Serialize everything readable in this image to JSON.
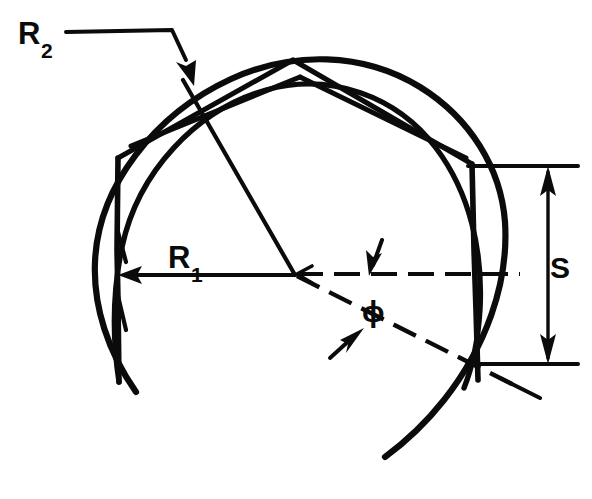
{
  "figure": {
    "background_color": "#ffffff",
    "line_color": "#0b0b0b",
    "width": 592,
    "height": 499,
    "labels": {
      "r2": {
        "base": "R",
        "subscript": "2",
        "x": 18,
        "y": 44
      },
      "r1": {
        "base": "R",
        "subscript": "1",
        "x": 168,
        "y": 268
      },
      "phi": {
        "text": "ϕ",
        "x": 362,
        "y": 322
      },
      "s": {
        "text": "S",
        "x": 550,
        "y": 278
      }
    },
    "geometry": {
      "center": {
        "x": 295,
        "y": 275
      },
      "outer_arc_radius": 203,
      "inner_arc_radius": 178,
      "apex": {
        "x": 293,
        "y": 60
      },
      "left_vertical_x": 118,
      "right_vertical_x": 475,
      "r1_arrow_tip": {
        "x": 120,
        "y": 275
      },
      "r2_arrow_tip": {
        "x": 178,
        "y": 72
      },
      "dimension_line_x": 548,
      "dimension_top_y": 166,
      "dimension_bottom_y": 364
    }
  }
}
